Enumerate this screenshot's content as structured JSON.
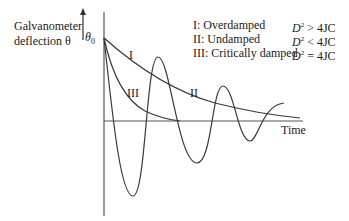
{
  "axes": {
    "y_label_line1": "Galvanometer",
    "y_label_line2": "deflection θ",
    "y_start_label": "θ",
    "y_start_sub": "0",
    "x_label": "Time"
  },
  "legend": [
    {
      "label": "I: Overdamped",
      "var": "D",
      "exp": "2",
      "cond": " > 4JC"
    },
    {
      "label": "II: Undamped",
      "var": "D",
      "exp": "2",
      "cond": " < 4JC"
    },
    {
      "label": "III: Critically damped",
      "var": "D",
      "exp": "2",
      "cond": " = 4JC"
    }
  ],
  "curve_labels": {
    "I": "I",
    "II": "II",
    "III": "III"
  },
  "colors": {
    "line": "#3a3a3a",
    "axis": "#555555",
    "text": "#1a1a1a"
  }
}
